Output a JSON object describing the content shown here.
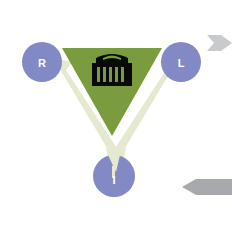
{
  "canvas": {
    "width": 232,
    "height": 229,
    "background": "#ffffff"
  },
  "diagram": {
    "title": "",
    "type": "triangular-cycle-diagram",
    "center_icon": {
      "name": "classical-building-icon",
      "color": "#0a0a0a",
      "description": "museum / institution building with columns"
    },
    "core_shape": {
      "name": "green-inverted-triangle",
      "color": "#7a9c3e"
    },
    "cycle_arrows": {
      "name": "pale-v-arrows",
      "color": "#e5e9d0"
    },
    "nodes": [
      {
        "id": "r",
        "label": "R",
        "color": "#8289c4",
        "position": "left"
      },
      {
        "id": "l",
        "label": "L",
        "color": "#8289c4",
        "position": "right"
      },
      {
        "id": "i",
        "label": "I",
        "color": "#8289c4",
        "position": "bottom"
      }
    ],
    "side_markers": [
      {
        "id": "marker-top-right",
        "label": "",
        "color": "#c9cacc",
        "direction": "right"
      },
      {
        "id": "marker-bottom-right",
        "label": "",
        "color": "#a7a9ac",
        "direction": "left"
      }
    ]
  }
}
